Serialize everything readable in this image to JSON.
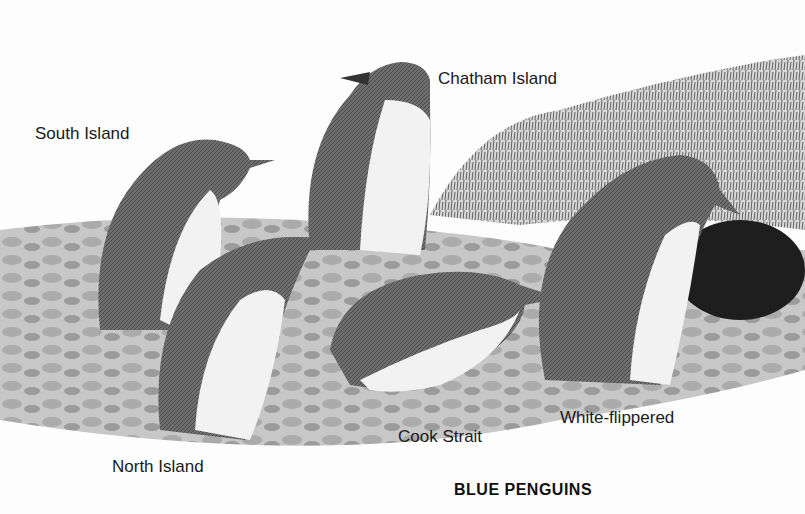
{
  "title": "BLUE PENGUINS",
  "labels": {
    "south_island": "South Island",
    "chatham_island": "Chatham Island",
    "north_island": "North Island",
    "cook_strait": "Cook Strait",
    "white_flippered": "White-flippered"
  },
  "colors": {
    "background": "#fdfdfd",
    "ink": "#1a1a1a",
    "penguin_back": "#6a6a6a",
    "penguin_belly": "#f2f2f2",
    "rocks": "#a8a8a8",
    "grass": "#7a7a7a"
  }
}
